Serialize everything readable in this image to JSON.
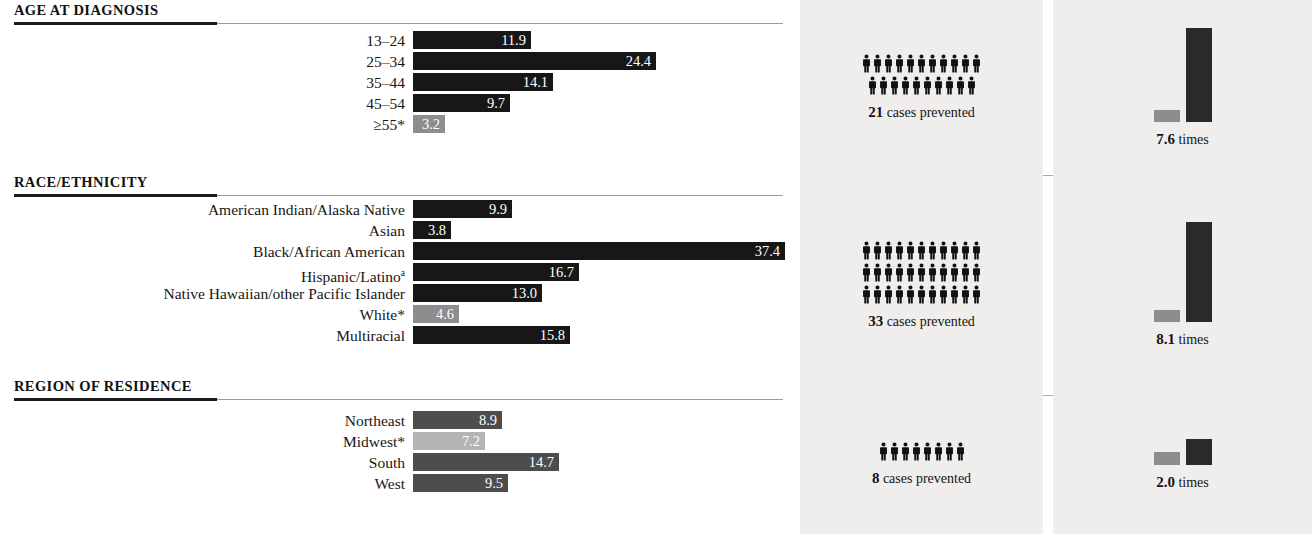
{
  "top_caption": "then__cases would have been prevented.",
  "chart_data": {
    "type": "bar",
    "title": "",
    "xlabel": "",
    "ylabel": "",
    "orientation": "horizontal",
    "xlim": [
      0,
      37.4
    ],
    "grid": false,
    "legend": null,
    "value_scale_px_per_unit": 9.95,
    "sections": [
      {
        "id": "age-at-diagnosis",
        "heading": "AGE AT DIAGNOSIS",
        "categories": [
          "13–24",
          "25–34",
          "35–44",
          "45–54",
          "≥55*"
        ],
        "values": [
          11.9,
          24.4,
          14.1,
          9.7,
          3.2
        ],
        "value_labels": [
          "11.9",
          "24.4",
          "14.1",
          "9.7",
          "3.2"
        ],
        "reference_index": 4,
        "panel": {
          "cases_number": "21",
          "cases_label": "cases prevented",
          "people_rows": [
            11,
            10
          ],
          "ratio_number": "7.6",
          "ratio_label": "times",
          "ratio_value": 7.6
        }
      },
      {
        "id": "race-ethnicity",
        "heading": "RACE/ETHNICITY",
        "categories": [
          "American Indian/Alaska Native",
          "Asian",
          "Black/African American",
          "Hispanic/Latino",
          "Native Hawaiian/other Pacific Islander",
          "White*",
          "Multiracial"
        ],
        "category_superscripts": [
          "",
          "",
          "",
          "a",
          "",
          "",
          ""
        ],
        "values": [
          9.9,
          3.8,
          37.4,
          16.7,
          13.0,
          4.6,
          15.8
        ],
        "value_labels": [
          "9.9",
          "3.8",
          "37.4",
          "16.7",
          "13.0",
          "4.6",
          "15.8"
        ],
        "reference_index": 5,
        "panel": {
          "cases_number": "33",
          "cases_label": "cases prevented",
          "people_rows": [
            11,
            11,
            11
          ],
          "ratio_number": "8.1",
          "ratio_label": "times",
          "ratio_value": 8.1
        }
      },
      {
        "id": "region-of-residence",
        "heading": "REGION OF RESIDENCE",
        "categories": [
          "Northeast",
          "Midwest*",
          "South",
          "West"
        ],
        "values": [
          8.9,
          7.2,
          14.7,
          9.5
        ],
        "value_labels": [
          "8.9",
          "7.2",
          "14.7",
          "9.5"
        ],
        "reference_index": 1,
        "panel": {
          "cases_number": "8",
          "cases_label": "cases prevented",
          "people_rows": [
            8
          ],
          "ratio_number": "2.0",
          "ratio_label": "times",
          "ratio_value": 2.0
        }
      }
    ]
  },
  "colors": {
    "bar_dark": "#171717",
    "bar_reference": "#8d8d8d",
    "bar_region": "#4d4d4d",
    "bar_region_reference": "#b4b4b4",
    "panel_background": "#efeeec",
    "rule_dark": "#1b1b1b",
    "rule_light": "#9a9a9a",
    "text": "#141414",
    "value_text": "#ffffff"
  }
}
